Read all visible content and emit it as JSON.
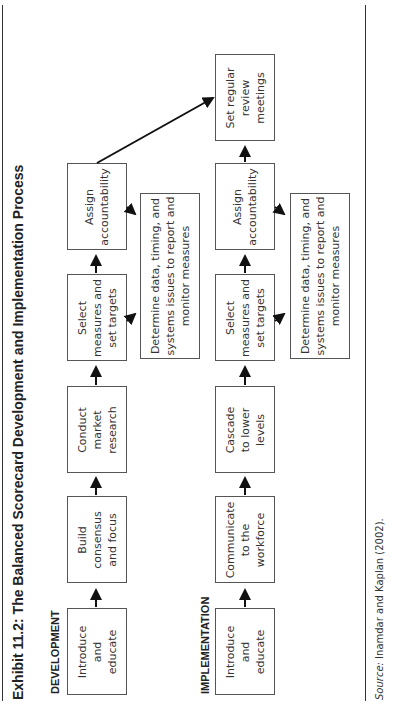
{
  "title": "Exhibit 11.2: The Balanced Scorecard Development and Implementation Process",
  "sections": {
    "development": {
      "label": "DEVELOPMENT",
      "steps": [
        {
          "lines": [
            "Introduce",
            "and",
            "educate"
          ]
        },
        {
          "lines": [
            "Build",
            "consensus",
            "and focus"
          ]
        },
        {
          "lines": [
            "Conduct",
            "market",
            "research"
          ]
        },
        {
          "lines": [
            "Select",
            "measures and",
            "set targets"
          ]
        },
        {
          "lines": [
            "Assign",
            "accountability"
          ]
        }
      ],
      "side_box": {
        "lines": [
          "Determine data, timing, and",
          "systems issues to report and",
          "monitor measures"
        ]
      }
    },
    "implementation": {
      "label": "IMPLEMENTATION",
      "steps": [
        {
          "lines": [
            "Introduce",
            "and",
            "educate"
          ]
        },
        {
          "lines": [
            "Communicate",
            "to the",
            "workforce"
          ]
        },
        {
          "lines": [
            "Cascade",
            "to lower",
            "levels"
          ]
        },
        {
          "lines": [
            "Select",
            "measures and",
            "set targets"
          ]
        },
        {
          "lines": [
            "Assign",
            "accountability"
          ]
        },
        {
          "lines": [
            "Set regular",
            "review",
            "meetings"
          ]
        }
      ],
      "side_box": {
        "lines": [
          "Determine data, timing, and",
          "systems issues to report and",
          "monitor measures"
        ]
      }
    }
  },
  "source": {
    "prefix": "Source:",
    "text": " Inamdar and Kaplan (2002)."
  },
  "colors": {
    "border": "#555555",
    "text": "#333333",
    "arrow": "#111111"
  }
}
